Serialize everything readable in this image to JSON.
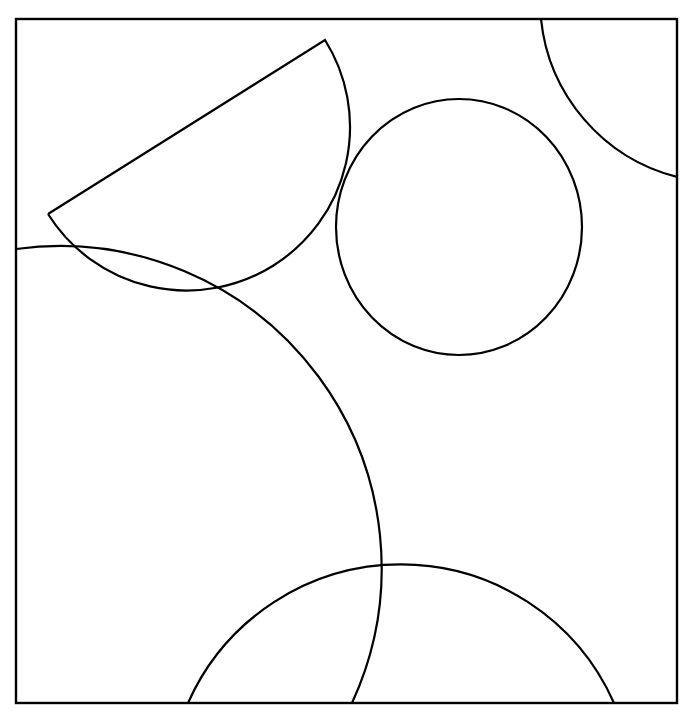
{
  "diagram": {
    "type": "geometric-figure",
    "background": "#ffffff",
    "stroke_color": "#000000",
    "frame": {
      "x": 16,
      "y": 19,
      "width": 661,
      "height": 684
    },
    "shapes": [
      {
        "id": "circle",
        "kind": "ellipse",
        "cx": 459,
        "cy": 227,
        "rx": 123,
        "ry": 128
      },
      {
        "id": "sector",
        "kind": "circular-sector",
        "apex": [
          48,
          214
        ],
        "corner": [
          325,
          40
        ],
        "path": "M 48 214 L 325 40 A 150 150 0 0 1 48 214"
      },
      {
        "id": "large-arc",
        "kind": "arc",
        "path": "M 16 249 A 322 322 0 0 1 352 703"
      },
      {
        "id": "bottom-arc",
        "kind": "arc",
        "path": "M 188 703 A 233 233 0 0 1 614 703"
      },
      {
        "id": "top-right-arc",
        "kind": "arc",
        "path": "M 541 19 A 182 182 0 0 0 677 177"
      }
    ]
  }
}
